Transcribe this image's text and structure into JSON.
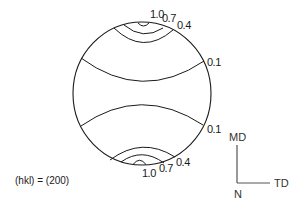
{
  "figure": {
    "type": "pole-figure",
    "reflection_label": "(hkl) = (200)",
    "line_color": "#1a1a1a"
  },
  "contours": {
    "top": [
      {
        "level": "1.0"
      },
      {
        "level": "0.7"
      },
      {
        "level": "0.4"
      },
      {
        "level": "0.1"
      }
    ],
    "bottom": [
      {
        "level": "0.1"
      },
      {
        "level": "0.4"
      },
      {
        "level": "0.7"
      },
      {
        "level": "1.0"
      }
    ]
  },
  "labels": {
    "top_1_0": "1.0",
    "top_0_7": "0.7",
    "top_0_4": "0.4",
    "top_0_1": "0.1",
    "bottom_0_1": "0.1",
    "bottom_0_4": "0.4",
    "bottom_0_7": "0.7",
    "bottom_1_0": "1.0"
  },
  "axes": {
    "md": "MD",
    "td": "TD",
    "n": "N"
  }
}
